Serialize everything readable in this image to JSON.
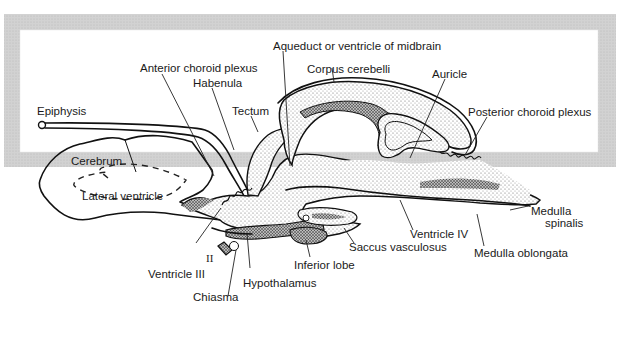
{
  "figure": {
    "type": "anatomical-diagram",
    "labels": {
      "aqueduct": "Aqueduct or ventricle of midbrain",
      "corpus_cerebelli": "Corpus cerebelli",
      "anterior_choroid_plexus": "Anterior choroid plexus",
      "habenula": "Habenula",
      "auricle": "Auricle",
      "epiphysis": "Epiphysis",
      "tectum": "Tectum",
      "posterior_choroid_plexus": "Posterior choroid plexus",
      "cerebrum": "Cerebrum",
      "lateral_ventricle": "Lateral ventricle",
      "medulla_spinalis_1": "Medulla",
      "medulla_spinalis_2": "spinalis",
      "ventricle_iv": "Ventricle IV",
      "medulla_oblongata": "Medulla oblongata",
      "saccus_vasculosus": "Saccus vasculosus",
      "nerve_ii": "II",
      "ventricle_iii": "Ventricle III",
      "inferior_lobe": "Inferior lobe",
      "hypothalamus": "Hypothalamus",
      "chiasma": "Chiasma"
    },
    "colors": {
      "frame": "#cbcbcb",
      "plate": "#ffffff",
      "ink": "#111111",
      "stipple": "#8a8a8a"
    }
  }
}
